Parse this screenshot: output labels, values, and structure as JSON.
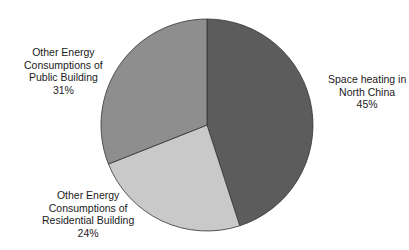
{
  "chart_data": {
    "type": "pie",
    "title": "",
    "start_angle_deg": 0,
    "direction": "clockwise",
    "categories": [
      "Space heating in North China",
      "Other Energy Consumptions of Residential Building",
      "Other Energy Consumptions of Public Building"
    ],
    "values": [
      45,
      24,
      31
    ],
    "unit": "%",
    "colors": [
      "#5c5c5c",
      "#c9c9c9",
      "#8e8e8e"
    ],
    "legend": "none (direct labels)"
  },
  "labels": [
    {
      "lines": [
        "Space heating in",
        "North China"
      ],
      "pct": "45%"
    },
    {
      "lines": [
        "Other Energy",
        "Consumptions of",
        "Residential Building"
      ],
      "pct": "24%"
    },
    {
      "lines": [
        "Other Energy",
        "Consumptions of",
        "Public Building"
      ],
      "pct": "31%"
    }
  ],
  "stroke_color": "#333333"
}
